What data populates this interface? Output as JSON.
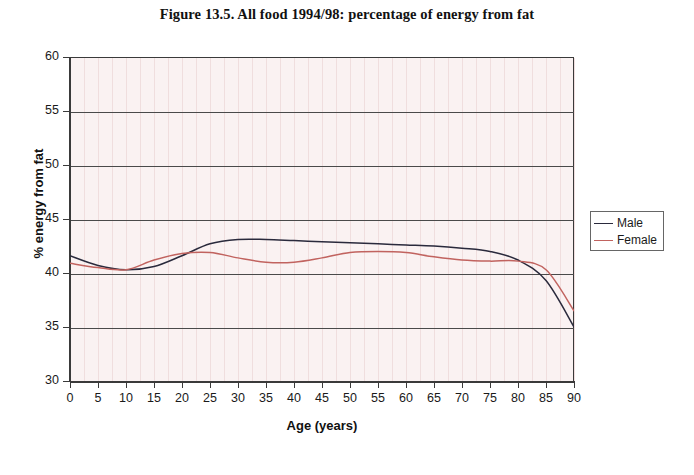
{
  "chart_data": {
    "type": "line",
    "title": "Figure 13.5. All food 1994/98: percentage of energy from fat",
    "xlabel": "Age (years)",
    "ylabel": "% energy from fat",
    "xlim": [
      0,
      90
    ],
    "ylim": [
      30,
      60
    ],
    "xticks": [
      0,
      5,
      10,
      15,
      20,
      25,
      30,
      35,
      40,
      45,
      50,
      55,
      60,
      65,
      70,
      75,
      80,
      85,
      90
    ],
    "yticks": [
      30,
      35,
      40,
      45,
      50,
      55,
      60
    ],
    "grid": "horizontal-major-and-vertical-minor",
    "legend_position": "right",
    "x": [
      0,
      5,
      10,
      15,
      20,
      25,
      30,
      35,
      40,
      45,
      50,
      55,
      60,
      65,
      70,
      75,
      80,
      85,
      90
    ],
    "series": [
      {
        "name": "Male",
        "color": "#2a2a3c",
        "values": [
          41.6,
          40.7,
          40.3,
          40.6,
          41.6,
          42.7,
          43.1,
          43.1,
          43.0,
          42.9,
          42.8,
          42.7,
          42.6,
          42.5,
          42.3,
          42.0,
          41.2,
          39.3,
          35.0
        ]
      },
      {
        "name": "Female",
        "color": "#c1635f",
        "values": [
          40.9,
          40.5,
          40.3,
          41.2,
          41.8,
          41.9,
          41.4,
          41.0,
          41.0,
          41.4,
          41.9,
          42.0,
          41.9,
          41.5,
          41.2,
          41.1,
          41.1,
          40.3,
          36.5
        ]
      }
    ]
  },
  "legend": {
    "entries": [
      {
        "label": "Male",
        "color": "#2a2a3c"
      },
      {
        "label": "Female",
        "color": "#c1635f"
      }
    ]
  }
}
